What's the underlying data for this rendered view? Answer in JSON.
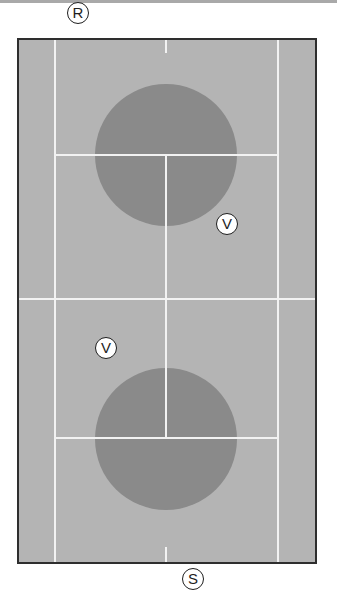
{
  "diagram": {
    "type": "tennis-court-doubles-top-view",
    "colors": {
      "court_surface": "#b4b4b4",
      "target_zone": "#8a8a8a",
      "court_lines": "#f2f2f2",
      "court_border": "#2e2e2e",
      "background": "#ffffff"
    },
    "players": [
      {
        "id": "receiver",
        "label": "R",
        "x": 78,
        "y": 13
      },
      {
        "id": "volleyer-top",
        "label": "V",
        "x": 227,
        "y": 224
      },
      {
        "id": "volleyer-bottom",
        "label": "V",
        "x": 106,
        "y": 348
      },
      {
        "id": "server",
        "label": "S",
        "x": 193,
        "y": 579
      }
    ],
    "target_zones": [
      {
        "id": "zone-top",
        "cx": 166,
        "cy": 155,
        "r": 71
      },
      {
        "id": "zone-bottom",
        "cx": 166,
        "cy": 439,
        "r": 71
      }
    ]
  }
}
